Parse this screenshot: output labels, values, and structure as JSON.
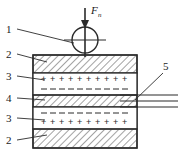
{
  "figure": {
    "force_label": "F",
    "force_subscript": "n",
    "background_color": "#ffffff",
    "line_color": "#2b2b2b",
    "hatch_color": "#555555"
  },
  "callouts": [
    {
      "id": "c1",
      "label": "1",
      "target": "loading-ball",
      "x": 9,
      "y": 32
    },
    {
      "id": "c2",
      "label": "2",
      "target": "top-electrode-plate",
      "x": 9,
      "y": 57
    },
    {
      "id": "c3",
      "label": "3",
      "target": "upper-charged-layer",
      "x": 9,
      "y": 79
    },
    {
      "id": "c4",
      "label": "4",
      "target": "center-electrode",
      "x": 9,
      "y": 101
    },
    {
      "id": "c5",
      "label": "3",
      "target": "lower-charged-layer",
      "x": 9,
      "y": 121
    },
    {
      "id": "c6",
      "label": "2",
      "target": "bottom-electrode-plate",
      "x": 9,
      "y": 143
    },
    {
      "id": "c7",
      "label": "5",
      "target": "lead-wires",
      "x": 166,
      "y": 72
    }
  ],
  "layers": [
    {
      "name": "top-electrode-plate",
      "ref": "2",
      "fill": "hatch",
      "y": 55,
      "height": 18
    },
    {
      "name": "upper-charged-layer",
      "ref": "3",
      "fill": "plain",
      "y": 73,
      "height": 22,
      "charge_rows": [
        {
          "sign": "+",
          "count": 10
        },
        {
          "sign": "–",
          "count": 10
        }
      ]
    },
    {
      "name": "center-electrode",
      "ref": "4",
      "fill": "hatch",
      "y": 95,
      "height": 12
    },
    {
      "name": "lower-charged-layer",
      "ref": "3",
      "fill": "plain",
      "y": 107,
      "height": 22,
      "charge_rows": [
        {
          "sign": "–",
          "count": 10
        },
        {
          "sign": "+",
          "count": 10
        }
      ]
    },
    {
      "name": "bottom-electrode-plate",
      "ref": "2",
      "fill": "hatch",
      "y": 129,
      "height": 19
    }
  ],
  "body": {
    "x": 33,
    "y": 55,
    "width": 104,
    "height": 93
  },
  "ball": {
    "cx": 85,
    "cy": 40,
    "r": 13
  },
  "arrow": {
    "x": 85,
    "y_start": 8,
    "y_end": 58,
    "label_x": 92,
    "label_y": 14
  },
  "lead_wires": {
    "count": 3,
    "x_start": 120,
    "x_end": 178,
    "ys": [
      95,
      101,
      107
    ]
  }
}
